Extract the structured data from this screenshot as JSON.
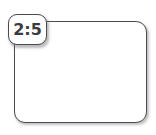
{
  "diagram": {
    "background_color": "#ffffff",
    "width": 156,
    "height": 135,
    "shape": {
      "name": "rounded-rectangle",
      "fill_color": "#ffffff",
      "border_color": "#4a4a4f",
      "shadow_color": "#78787d"
    },
    "label": {
      "text": "2:5",
      "type": "ratio",
      "fill_color": "#ffffff",
      "border_color": "#4a4a4f",
      "text_color": "#3a3a3f"
    }
  }
}
